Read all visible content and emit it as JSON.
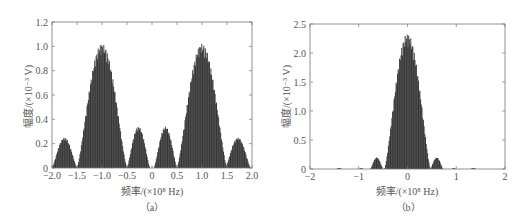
{
  "chart_data": [
    {
      "panel": "a",
      "type": "area",
      "caption": "（a）",
      "title": "",
      "xlabel": "频率/(×10⁸ Hz)",
      "ylabel": "幅度/(×10⁻³ V)",
      "xlim": [
        -2.0,
        2.0
      ],
      "ylim": [
        0,
        1.2
      ],
      "xticks": [
        "-2.0",
        "-1.5",
        "-1.0",
        "-0.5",
        "0",
        "0.5",
        "1.0",
        "1.5",
        "2.0"
      ],
      "yticks": [
        "0",
        "0.2",
        "0.4",
        "0.6",
        "0.8",
        "1.0",
        "1.2"
      ],
      "grid": false,
      "color": "#2a2a2a",
      "lobes": [
        {
          "center": -1.75,
          "halfwidth": 0.25,
          "peak": 0.25
        },
        {
          "center": -1.0,
          "halfwidth": 0.5,
          "peak": 1.02
        },
        {
          "center": -0.27,
          "halfwidth": 0.23,
          "peak": 0.34
        },
        {
          "center": 0.27,
          "halfwidth": 0.23,
          "peak": 0.34
        },
        {
          "center": 1.0,
          "halfwidth": 0.5,
          "peak": 1.02
        },
        {
          "center": 1.72,
          "halfwidth": 0.25,
          "peak": 0.25
        }
      ],
      "floor_bumps": [
        {
          "center": -1.0,
          "halfwidth": 0.5,
          "peak": 0.02
        },
        {
          "center": 1.0,
          "halfwidth": 0.5,
          "peak": 0.02
        }
      ]
    },
    {
      "panel": "b",
      "type": "area",
      "caption": "（b）",
      "title": "",
      "xlabel": "频率/(×10⁸ Hz)",
      "ylabel": "幅度/(×10⁻³ V)",
      "xlim": [
        -2,
        2
      ],
      "ylim": [
        0,
        2.5
      ],
      "xticks": [
        "-2",
        "-1",
        "0",
        "1",
        "2"
      ],
      "yticks": [
        "0",
        "0.5",
        "1.0",
        "1.5",
        "2.0",
        "2.5"
      ],
      "grid": false,
      "color": "#2a2a2a",
      "lobes": [
        {
          "center": -0.63,
          "halfwidth": 0.13,
          "peak": 0.2
        },
        {
          "center": 0.0,
          "halfwidth": 0.47,
          "peak": 2.33
        },
        {
          "center": 0.6,
          "halfwidth": 0.13,
          "peak": 0.2
        }
      ],
      "floor_bumps": [
        {
          "center": -1.4,
          "halfwidth": 0.06,
          "peak": 0.02
        },
        {
          "center": -0.95,
          "halfwidth": 0.04,
          "peak": 0.02
        },
        {
          "center": 0.95,
          "halfwidth": 0.04,
          "peak": 0.02
        },
        {
          "center": 1.35,
          "halfwidth": 0.06,
          "peak": 0.02
        }
      ]
    }
  ]
}
